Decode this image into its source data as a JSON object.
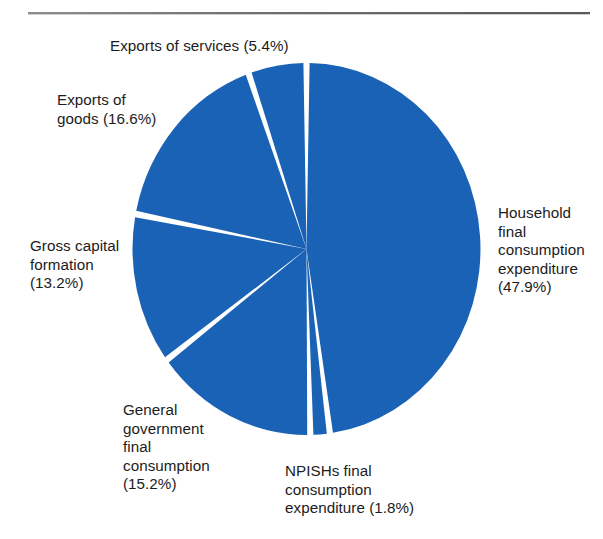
{
  "page": {
    "background_color": "#ffffff",
    "rule_color": "#6f6f6f"
  },
  "chart_data": {
    "type": "pie",
    "title": "",
    "subtitle": "",
    "xlabel": "",
    "ylabel": "",
    "legend_position": "none",
    "grid": false,
    "units": "percent",
    "slice_color": "#1a62b5",
    "separator_color": "#ffffff",
    "start_angle_deg": 0,
    "direction": "clockwise",
    "categories": [
      "Household final consumption expenditure",
      "NPISHs final consumption expenditure",
      "General government final consumption",
      "Gross capital formation",
      "Exports of goods",
      "Exports of services"
    ],
    "values": [
      47.9,
      1.8,
      15.2,
      13.2,
      16.6,
      5.4
    ],
    "slices": [
      {
        "name": "household",
        "label": "Household\nfinal\nconsumption\nexpenditure\n(47.9%)",
        "label_text": "Household final consumption expenditure",
        "value": 47.9,
        "value_text": "(47.9%)",
        "color": "#1a62b5"
      },
      {
        "name": "npishs",
        "label": "NPISHs final\nconsumption\nexpenditure (1.8%)",
        "label_text": "NPISHs final consumption expenditure",
        "value": 1.8,
        "value_text": "(1.8%)",
        "color": "#1a62b5"
      },
      {
        "name": "general-government",
        "label": "General\ngovernment\nfinal\nconsumption\n(15.2%)",
        "label_text": "General government final consumption",
        "value": 15.2,
        "value_text": "(15.2%)",
        "color": "#1a62b5"
      },
      {
        "name": "gross-capital-formation",
        "label": "Gross capital\nformation\n(13.2%)",
        "label_text": "Gross capital formation",
        "value": 13.2,
        "value_text": "(13.2%)",
        "color": "#1a62b5"
      },
      {
        "name": "exports-of-goods",
        "label": "Exports of\ngoods (16.6%)",
        "label_text": "Exports of goods",
        "value": 16.6,
        "value_text": "(16.6%)",
        "color": "#1a62b5"
      },
      {
        "name": "exports-of-services",
        "label": "Exports of services (5.4%)",
        "label_text": "Exports of services",
        "value": 5.4,
        "value_text": "(5.4%)",
        "color": "#1a62b5"
      }
    ]
  }
}
